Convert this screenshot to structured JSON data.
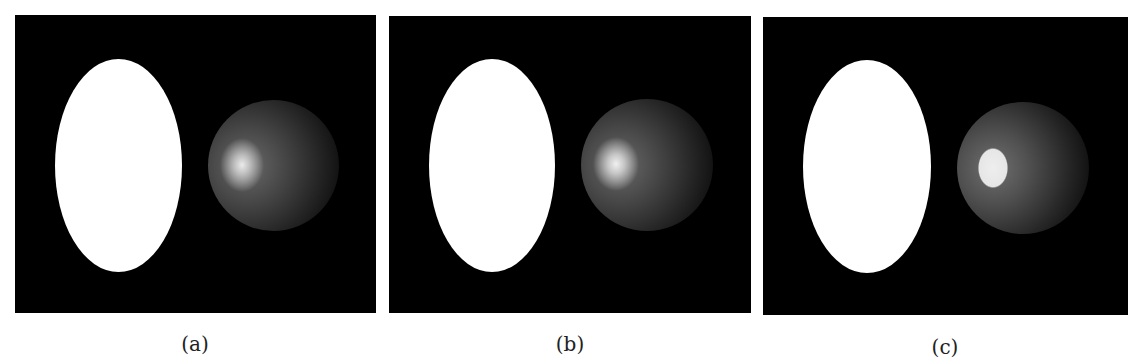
{
  "figure": {
    "panels": [
      {
        "id": "a",
        "caption": "(a)",
        "highlight": "soft"
      },
      {
        "id": "b",
        "caption": "(b)",
        "highlight": "soft"
      },
      {
        "id": "c",
        "caption": "(c)",
        "highlight": "sharp"
      }
    ],
    "colors": {
      "background": "#000000",
      "ellipse": "#ffffff",
      "page": "#ffffff"
    }
  }
}
